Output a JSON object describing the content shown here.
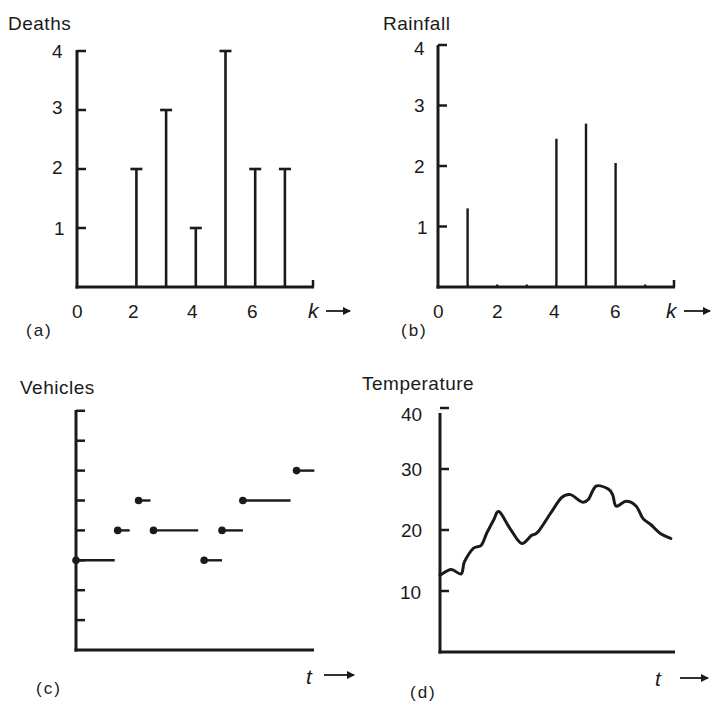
{
  "chart_data": [
    {
      "panel": "(a)",
      "type": "bar",
      "title": "Deaths",
      "xlabel": "k",
      "ylabel": "Deaths",
      "x_ticks": [
        "0",
        "2",
        "4",
        "6"
      ],
      "y_ticks": [
        "1",
        "2",
        "3",
        "4"
      ],
      "ylim": [
        0,
        4
      ],
      "xlim": [
        0,
        7.5
      ],
      "style": "stem with T-caps",
      "x": [
        2,
        3,
        4,
        5,
        6,
        7
      ],
      "values": [
        2,
        3,
        1,
        4,
        2,
        2
      ]
    },
    {
      "panel": "(b)",
      "type": "bar",
      "title": "Rainfall",
      "xlabel": "k",
      "ylabel": "Rainfall",
      "x_ticks": [
        "0",
        "2",
        "4",
        "6"
      ],
      "y_ticks": [
        "1",
        "2",
        "3",
        "4"
      ],
      "ylim": [
        0,
        4
      ],
      "xlim": [
        0,
        7.5
      ],
      "style": "thin stems",
      "x": [
        1,
        4,
        5,
        6
      ],
      "values": [
        1.3,
        2.45,
        2.7,
        2.05
      ]
    },
    {
      "panel": "(c)",
      "type": "line",
      "title": "Vehicles",
      "xlabel": "t",
      "ylabel": "Vehicles",
      "x_ticks": [],
      "y_ticks_unlabeled": 8,
      "ylim": [
        0,
        8
      ],
      "style": "step function, filled dot at left end of each segment",
      "segments": [
        {
          "t_start": 0.0,
          "t_end": 1.3,
          "value": 3
        },
        {
          "t_start": 1.4,
          "t_end": 1.8,
          "value": 4
        },
        {
          "t_start": 2.1,
          "t_end": 2.5,
          "value": 5
        },
        {
          "t_start": 2.6,
          "t_end": 4.1,
          "value": 4
        },
        {
          "t_start": 4.3,
          "t_end": 4.9,
          "value": 3
        },
        {
          "t_start": 4.9,
          "t_end": 5.6,
          "value": 4
        },
        {
          "t_start": 5.6,
          "t_end": 7.2,
          "value": 5
        },
        {
          "t_start": 7.4,
          "t_end": 8.0,
          "value": 6
        }
      ]
    },
    {
      "panel": "(d)",
      "type": "line",
      "title": "Temperature",
      "xlabel": "t",
      "ylabel": "Temperature",
      "y_ticks": [
        "10",
        "20",
        "30",
        "40"
      ],
      "ylim": [
        0,
        40
      ],
      "style": "continuous wiggly curve",
      "x": [
        0,
        0.5,
        0.95,
        1.1,
        1.5,
        1.85,
        2.1,
        2.4,
        2.65,
        3.15,
        3.65,
        4.1,
        4.4,
        4.95,
        5.45,
        5.85,
        6.35,
        6.65,
        7.0,
        7.55,
        7.75,
        7.9,
        8.35,
        8.8,
        9.1,
        9.45,
        9.85,
        10.35
      ],
      "values": [
        12.6,
        13.5,
        12.8,
        14.8,
        17.0,
        17.5,
        19.5,
        21.6,
        23.0,
        20.2,
        17.8,
        19.1,
        19.7,
        22.7,
        25.3,
        25.8,
        24.6,
        25.0,
        27.2,
        26.7,
        25.7,
        23.9,
        24.7,
        23.9,
        21.9,
        20.9,
        19.5,
        18.6
      ]
    }
  ],
  "panels": {
    "a": {
      "title": "Deaths",
      "label": "(a)",
      "xvar": "k",
      "arrow": "→",
      "x_ticks": [
        "0",
        "2",
        "4",
        "6"
      ],
      "y_ticks": [
        "1",
        "2",
        "3",
        "4"
      ]
    },
    "b": {
      "title": "Rainfall",
      "label": "(b)",
      "xvar": "k",
      "arrow": "→",
      "x_ticks": [
        "0",
        "2",
        "4",
        "6"
      ],
      "y_ticks": [
        "1",
        "2",
        "3",
        "4"
      ]
    },
    "c": {
      "title": "Vehicles",
      "label": "(c)",
      "xvar": "t",
      "arrow": "→"
    },
    "d": {
      "title": "Temperature",
      "label": "(d)",
      "xvar": "t",
      "arrow": "→",
      "y_ticks": [
        "10",
        "20",
        "30",
        "40"
      ]
    }
  },
  "colors": {
    "ink": "#1a1a1a",
    "background": "#ffffff"
  }
}
